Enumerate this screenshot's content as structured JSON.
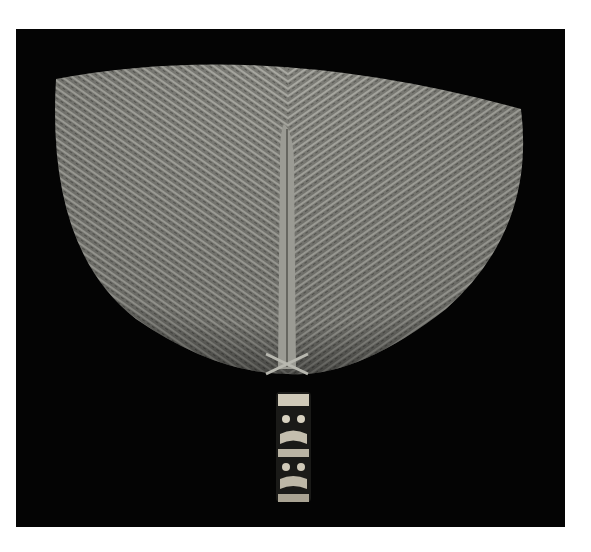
{
  "image": {
    "subject": "woven fan with carved handle",
    "background_color": "#040404",
    "border_color": "#ffffff",
    "fan_color": "#8a8a84",
    "handle_color": "#cfc9b8"
  }
}
